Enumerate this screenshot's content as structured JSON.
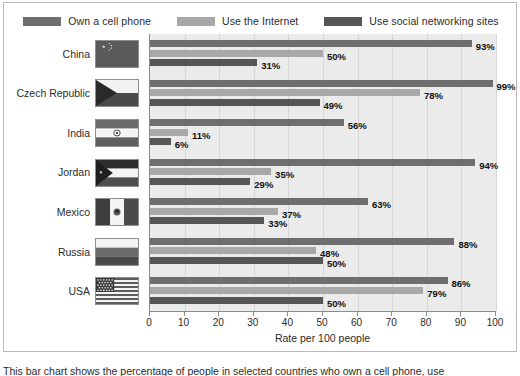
{
  "legend": {
    "items": [
      {
        "label": "Own a cell phone",
        "color": "#6e6e6e"
      },
      {
        "label": "Use the Internet",
        "color": "#a8a8a8"
      },
      {
        "label": "Use social networking sites",
        "color": "#565656"
      }
    ]
  },
  "axis": {
    "x_title": "Rate per 100 people",
    "ticks": [
      "0",
      "10",
      "20",
      "30",
      "40",
      "50",
      "60",
      "70",
      "80",
      "90",
      "100"
    ]
  },
  "countries": [
    {
      "name": "China",
      "flag": "flag-china"
    },
    {
      "name": "Czech Republic",
      "flag": "flag-czech-republic"
    },
    {
      "name": "India",
      "flag": "flag-india"
    },
    {
      "name": "Jordan",
      "flag": "flag-jordan"
    },
    {
      "name": "Mexico",
      "flag": "flag-mexico"
    },
    {
      "name": "Russia",
      "flag": "flag-russia"
    },
    {
      "name": "USA",
      "flag": "flag-usa"
    }
  ],
  "labels": {
    "china": [
      "93%",
      "50%",
      "31%"
    ],
    "czech": [
      "99%",
      "78%",
      "49%"
    ],
    "india": [
      "56%",
      "11%",
      "6%"
    ],
    "jordan": [
      "94%",
      "35%",
      "29%"
    ],
    "mexico": [
      "63%",
      "37%",
      "33%"
    ],
    "russia": [
      "88%",
      "48%",
      "50%"
    ],
    "usa": [
      "86%",
      "79%",
      "50%"
    ]
  },
  "caption": {
    "text": "This bar chart shows the percentage of people in selected countries who own a cell phone, use"
  },
  "chart_data": {
    "type": "bar",
    "orientation": "horizontal",
    "title": "",
    "xlabel": "Rate per 100 people",
    "ylabel": "",
    "xlim": [
      0,
      100
    ],
    "xticks": [
      0,
      10,
      20,
      30,
      40,
      50,
      60,
      70,
      80,
      90,
      100
    ],
    "grid": true,
    "legend_position": "top",
    "categories": [
      "China",
      "Czech Republic",
      "India",
      "Jordan",
      "Mexico",
      "Russia",
      "USA"
    ],
    "series": [
      {
        "name": "Own a cell phone",
        "color": "#6e6e6e",
        "values": [
          93,
          99,
          56,
          94,
          63,
          88,
          86
        ]
      },
      {
        "name": "Use the Internet",
        "color": "#a8a8a8",
        "values": [
          50,
          78,
          11,
          35,
          37,
          48,
          79
        ]
      },
      {
        "name": "Use social networking sites",
        "color": "#565656",
        "values": [
          31,
          49,
          6,
          29,
          33,
          50,
          50
        ]
      }
    ]
  }
}
